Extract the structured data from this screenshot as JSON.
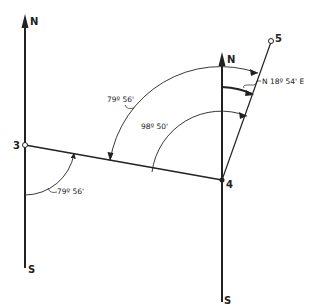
{
  "diagram": {
    "type": "survey traverse bearing diagram",
    "points": [
      {
        "id": "3",
        "label": "3"
      },
      {
        "id": "4",
        "label": "4"
      },
      {
        "id": "5",
        "label": "5"
      }
    ],
    "meridians": [
      {
        "station": "3",
        "north_label": "N",
        "south_label": "S"
      },
      {
        "station": "4",
        "north_label": "N",
        "south_label": "S"
      }
    ],
    "angles": {
      "at_3_from_south": "79º 56'",
      "at_4_from_north_to_3": "79º 56'",
      "at_4_deflection": "98º 50'",
      "bearing_4_to_5": "N 18º 54' E"
    },
    "colors": {
      "line": "#222222",
      "background": "#ffffff"
    }
  }
}
